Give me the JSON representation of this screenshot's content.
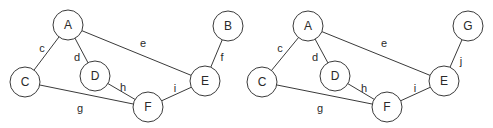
{
  "graphs": [
    {
      "nodes": [
        {
          "id": "A",
          "x": 68,
          "y": 25
        },
        {
          "id": "C",
          "x": 25,
          "y": 82
        },
        {
          "id": "D",
          "x": 95,
          "y": 76
        },
        {
          "id": "F",
          "x": 148,
          "y": 107
        },
        {
          "id": "E",
          "x": 205,
          "y": 81
        },
        {
          "id": "B",
          "x": 228,
          "y": 26
        }
      ],
      "edges": [
        {
          "label": "c",
          "from": "A",
          "to": "C",
          "lx": 42,
          "ly": 48
        },
        {
          "label": "d",
          "from": "A",
          "to": "D",
          "lx": 77,
          "ly": 57
        },
        {
          "label": "e",
          "from": "A",
          "to": "E",
          "lx": 143,
          "ly": 43
        },
        {
          "label": "f",
          "from": "B",
          "to": "E",
          "lx": 222,
          "ly": 57
        },
        {
          "label": "g",
          "from": "C",
          "to": "F",
          "lx": 80,
          "ly": 108
        },
        {
          "label": "h",
          "from": "D",
          "to": "F",
          "lx": 123,
          "ly": 87
        },
        {
          "label": "i",
          "from": "F",
          "to": "E",
          "lx": 175,
          "ly": 88
        }
      ]
    },
    {
      "nodes": [
        {
          "id": "A",
          "x": 308,
          "y": 26
        },
        {
          "id": "C",
          "x": 262,
          "y": 82
        },
        {
          "id": "D",
          "x": 335,
          "y": 76
        },
        {
          "id": "F",
          "x": 387,
          "y": 107
        },
        {
          "id": "E",
          "x": 444,
          "y": 81
        },
        {
          "id": "G",
          "x": 468,
          "y": 26
        }
      ],
      "edges": [
        {
          "label": "c",
          "from": "A",
          "to": "C",
          "lx": 280,
          "ly": 48
        },
        {
          "label": "d",
          "from": "A",
          "to": "D",
          "lx": 315,
          "ly": 57
        },
        {
          "label": "e",
          "from": "A",
          "to": "E",
          "lx": 384,
          "ly": 43
        },
        {
          "label": "j",
          "from": "G",
          "to": "E",
          "lx": 461,
          "ly": 61
        },
        {
          "label": "g",
          "from": "C",
          "to": "F",
          "lx": 320,
          "ly": 108
        },
        {
          "label": "h",
          "from": "D",
          "to": "F",
          "lx": 364,
          "ly": 88
        },
        {
          "label": "i",
          "from": "F",
          "to": "E",
          "lx": 415,
          "ly": 88
        }
      ]
    }
  ],
  "node_radius": 15
}
